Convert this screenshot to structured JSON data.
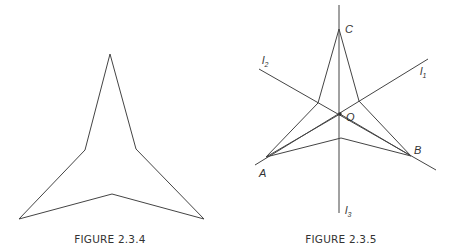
{
  "figures": [
    {
      "id": "left",
      "caption": "FIGURE 2.3.4",
      "shape": "concave hexagon (three-pointed star)",
      "vertices": [
        [
          110,
          54
        ],
        [
          136,
          149
        ],
        [
          204,
          219
        ],
        [
          112,
          194
        ],
        [
          19,
          219
        ],
        [
          85,
          150
        ]
      ]
    },
    {
      "id": "right",
      "caption": "FIGURE 2.3.5",
      "outer_points": {
        "C": {
          "label": "C",
          "pos": [
            339,
            29
          ]
        },
        "A": {
          "label": "A",
          "pos": [
            266,
            157
          ]
        },
        "B": {
          "label": "B",
          "pos": [
            411,
            156
          ]
        }
      },
      "center": {
        "label": "O",
        "pos": [
          340,
          114
        ]
      },
      "star_vertices": [
        [
          339,
          29
        ],
        [
          359,
          101
        ],
        [
          411,
          156
        ],
        [
          341,
          138
        ],
        [
          266,
          157
        ],
        [
          318,
          103
        ]
      ],
      "lines": [
        {
          "label": "l",
          "subscript": "1",
          "from": [
            255,
            165
          ],
          "to": [
            428,
            59
          ]
        },
        {
          "label": "l",
          "subscript": "2",
          "from": [
            259,
            69
          ],
          "to": [
            436,
            170
          ]
        },
        {
          "label": "l",
          "subscript": "3",
          "from": [
            339,
            5
          ],
          "to": [
            339,
            213
          ]
        }
      ],
      "labels": {
        "C": "C",
        "A": "A",
        "B": "B",
        "O": "O",
        "l1_main": "l",
        "l1_sub": "1",
        "l2_main": "l",
        "l2_sub": "2",
        "l3_main": "l",
        "l3_sub": "3"
      }
    }
  ],
  "colors": {
    "stroke": "#444444",
    "text": "#333333",
    "background": "#ffffff"
  }
}
